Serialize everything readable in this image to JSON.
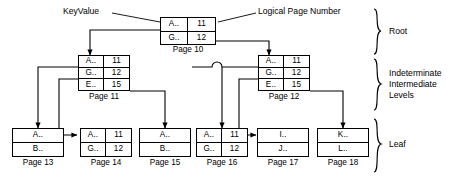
{
  "diagram": {
    "callouts": [
      {
        "id": "keyvalue",
        "text": "KeyValue"
      },
      {
        "id": "logical-page-number",
        "text": "Logical Page Number"
      }
    ],
    "level_labels": [
      {
        "id": "root",
        "text": "Root"
      },
      {
        "id": "intermediate",
        "line1": "Indeterminate",
        "line2": "Intermediate",
        "line3": "Levels"
      },
      {
        "id": "leaf",
        "text": "Leaf"
      }
    ],
    "nodes": [
      {
        "id": "page-10",
        "caption": "Page 10",
        "columns": 2,
        "rows": [
          {
            "key": "A..",
            "value": "11"
          },
          {
            "key": "G..",
            "value": "12"
          }
        ]
      },
      {
        "id": "page-11",
        "caption": "Page 11",
        "columns": 2,
        "rows": [
          {
            "key": "A..",
            "value": "11"
          },
          {
            "key": "G..",
            "value": "12"
          },
          {
            "key": "E..",
            "value": "15"
          }
        ]
      },
      {
        "id": "page-12",
        "caption": "Page 12",
        "columns": 2,
        "rows": [
          {
            "key": "A..",
            "value": "11"
          },
          {
            "key": "G..",
            "value": "12"
          },
          {
            "key": "E..",
            "value": "15"
          }
        ]
      },
      {
        "id": "page-13",
        "caption": "Page 13",
        "columns": 1,
        "rows": [
          {
            "key": "A..",
            "value": ""
          },
          {
            "key": "B..",
            "value": ""
          }
        ]
      },
      {
        "id": "page-14",
        "caption": "Page 14",
        "columns": 2,
        "rows": [
          {
            "key": "A..",
            "value": "11"
          },
          {
            "key": "G..",
            "value": "12"
          }
        ]
      },
      {
        "id": "page-15",
        "caption": "Page 15",
        "columns": 1,
        "rows": [
          {
            "key": "A..",
            "value": ""
          },
          {
            "key": "B..",
            "value": ""
          }
        ]
      },
      {
        "id": "page-16",
        "caption": "Page 16",
        "columns": 2,
        "rows": [
          {
            "key": "A..",
            "value": "11"
          },
          {
            "key": "G..",
            "value": "12"
          }
        ]
      },
      {
        "id": "page-17",
        "caption": "Page 17",
        "columns": 1,
        "rows": [
          {
            "key": "I..",
            "value": ""
          },
          {
            "key": "J..",
            "value": ""
          }
        ]
      },
      {
        "id": "page-18",
        "caption": "Page 18",
        "columns": 1,
        "rows": [
          {
            "key": "K..",
            "value": ""
          },
          {
            "key": "L..",
            "value": ""
          }
        ]
      }
    ],
    "colors": {
      "line": "#000000",
      "background": "#ffffff",
      "text": "#000000"
    }
  }
}
